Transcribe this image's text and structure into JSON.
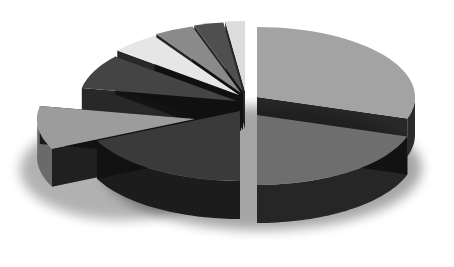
{
  "chart_data": {
    "type": "pie",
    "style": "3d-exploded",
    "title": "",
    "legend": null,
    "labels_visible": false,
    "slices": [
      {
        "id": "s1",
        "label": "",
        "value": 30,
        "top": "#a3a3a3",
        "side": "#2b2b2b"
      },
      {
        "id": "s2",
        "label": "",
        "value": 20,
        "top": "#6e6e6e",
        "side": "#262626"
      },
      {
        "id": "s3",
        "label": "",
        "value": 18,
        "top": "#3a3a3a",
        "side": "#1c1c1c"
      },
      {
        "id": "s4",
        "label": "",
        "value": 10,
        "top": "#9c9c9c",
        "side": "#6a6a6a"
      },
      {
        "id": "s5",
        "label": "",
        "value": 8,
        "top": "#444444",
        "side": "#0e0e0e"
      },
      {
        "id": "s6",
        "label": "",
        "value": 5,
        "top": "#e6e6e6",
        "side": "#bdbdbd"
      },
      {
        "id": "s7",
        "label": "",
        "value": 4,
        "top": "#8a8a8a",
        "side": "#1a1a1a"
      },
      {
        "id": "s8",
        "label": "",
        "value": 3,
        "top": "#4f4f4f",
        "side": "#151515"
      },
      {
        "id": "s9",
        "label": "",
        "value": 2,
        "top": "#dcdcdc",
        "side": "#9a9a9a"
      }
    ],
    "grid": false,
    "background": "#ffffff"
  }
}
